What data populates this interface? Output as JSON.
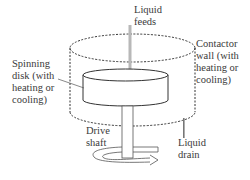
{
  "diagram": {
    "labels": {
      "liquid_feeds": [
        "Liquid",
        "feeds"
      ],
      "spinning_disk": [
        "Spinning",
        "disk (with",
        "heating or",
        "cooling)"
      ],
      "contactor_wall": [
        "Contactor",
        "wall (with",
        "heating or",
        "cooling)"
      ],
      "drive_shaft": [
        "Drive",
        "shaft"
      ],
      "liquid_drain": [
        "Liquid",
        "drain"
      ]
    },
    "colors": {
      "line": "#333333",
      "pipe": "#b0b0b0",
      "text": "#3a3a3a",
      "background": "#ffffff"
    }
  }
}
